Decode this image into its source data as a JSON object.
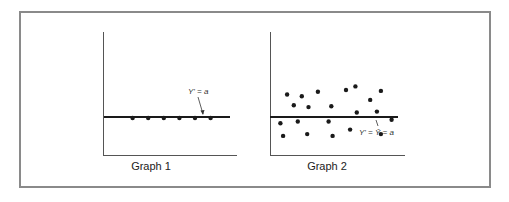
{
  "figure": {
    "frame_color": "#8a8a8a",
    "ink_color": "#1a1a1a"
  },
  "chart_data": [
    {
      "type": "scatter",
      "title": "Graph 1",
      "caption": "Graph 1",
      "annotation": "Y' = a",
      "line": {
        "label": "Y' = a",
        "y": 0.5
      },
      "points": [
        [
          0.22,
          0.5
        ],
        [
          0.34,
          0.5
        ],
        [
          0.46,
          0.5
        ],
        [
          0.58,
          0.5
        ],
        [
          0.7,
          0.5
        ],
        [
          0.82,
          0.5
        ]
      ],
      "xlabel": "",
      "ylabel": "",
      "grid": false
    },
    {
      "type": "scatter",
      "title": "Graph 2",
      "caption": "Graph 2",
      "annotation": "Y' = Ȳ = a",
      "line": {
        "label": "Y' = Ȳ = a",
        "y": 0.5
      },
      "points": [
        [
          0.12,
          0.75
        ],
        [
          0.23,
          0.73
        ],
        [
          0.35,
          0.78
        ],
        [
          0.56,
          0.8
        ],
        [
          0.63,
          0.84
        ],
        [
          0.82,
          0.79
        ],
        [
          0.74,
          0.69
        ],
        [
          0.17,
          0.63
        ],
        [
          0.28,
          0.61
        ],
        [
          0.45,
          0.62
        ],
        [
          0.64,
          0.55
        ],
        [
          0.79,
          0.56
        ],
        [
          0.9,
          0.47
        ],
        [
          0.07,
          0.43
        ],
        [
          0.2,
          0.45
        ],
        [
          0.43,
          0.45
        ],
        [
          0.59,
          0.36
        ],
        [
          0.09,
          0.29
        ],
        [
          0.27,
          0.31
        ],
        [
          0.46,
          0.29
        ],
        [
          0.82,
          0.31
        ]
      ],
      "xlabel": "",
      "ylabel": "",
      "grid": false
    }
  ]
}
